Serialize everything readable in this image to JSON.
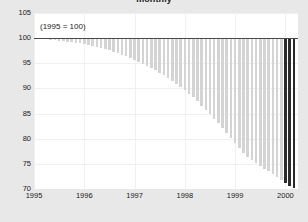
{
  "chart_data": {
    "type": "bar",
    "title": "monthly",
    "annotation": "(1995 = 100)",
    "xlabel": "",
    "ylabel": "",
    "ylim": [
      70,
      105
    ],
    "yticks": [
      105,
      100,
      95,
      90,
      85,
      80,
      75,
      70
    ],
    "xticks": [
      "1995",
      "1996",
      "1997",
      "1998",
      "1999",
      "2000"
    ],
    "xlim": [
      1995.0,
      2000.25
    ],
    "grid": true,
    "legend_position": "none",
    "baseline": 100,
    "bar_color": "#d4d4d4",
    "highlight_color": "#2b2b2b",
    "highlight_count": 3,
    "x": [
      1995.0,
      1995.083,
      1995.167,
      1995.25,
      1995.333,
      1995.417,
      1995.5,
      1995.583,
      1995.667,
      1995.75,
      1995.833,
      1995.917,
      1996.0,
      1996.083,
      1996.167,
      1996.25,
      1996.333,
      1996.417,
      1996.5,
      1996.583,
      1996.667,
      1996.75,
      1996.833,
      1996.917,
      1997.0,
      1997.083,
      1997.167,
      1997.25,
      1997.333,
      1997.417,
      1997.5,
      1997.583,
      1997.667,
      1997.75,
      1997.833,
      1997.917,
      1998.0,
      1998.083,
      1998.167,
      1998.25,
      1998.333,
      1998.417,
      1998.5,
      1998.583,
      1998.667,
      1998.75,
      1998.833,
      1998.917,
      1999.0,
      1999.083,
      1999.167,
      1999.25,
      1999.333,
      1999.417,
      1999.5,
      1999.583,
      1999.667,
      1999.75,
      1999.833,
      1999.917,
      2000.0,
      2000.083,
      2000.167
    ],
    "values": [
      100.0,
      99.9,
      99.8,
      99.8,
      99.7,
      99.6,
      99.5,
      99.4,
      99.3,
      99.2,
      99.1,
      99.0,
      98.9,
      98.7,
      98.5,
      98.3,
      98.1,
      97.9,
      97.6,
      97.3,
      97.0,
      96.7,
      96.4,
      96.1,
      95.7,
      95.3,
      94.9,
      94.5,
      94.1,
      93.6,
      93.1,
      92.6,
      92.1,
      91.5,
      90.9,
      90.3,
      89.6,
      88.9,
      88.2,
      87.4,
      86.6,
      85.8,
      84.9,
      84.0,
      83.1,
      82.1,
      81.1,
      80.1,
      79.1,
      78.1,
      77.2,
      76.4,
      75.7,
      75.1,
      74.5,
      74.0,
      73.5,
      73.0,
      72.4,
      71.8,
      71.2,
      70.6,
      70.1
    ]
  }
}
